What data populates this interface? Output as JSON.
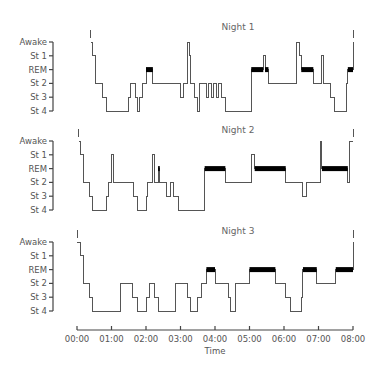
{
  "chart_data": {
    "type": "line",
    "subtype": "hypnogram (step plot)",
    "xlabel": "Time",
    "x_ticks": [
      "00:00",
      "01:00",
      "02:00",
      "03:00",
      "04:00",
      "05:00",
      "06:00",
      "07:00",
      "08:00"
    ],
    "xlim_hours": [
      0,
      8
    ],
    "y_levels": [
      "Awake",
      "St 1",
      "REM",
      "St 2",
      "St 3",
      "St 4"
    ],
    "legend": null,
    "grid": false,
    "annotations": "REM periods drawn as thick black bars",
    "panels": [
      {
        "title": "Night 1",
        "steps": [
          [
            0.4,
            "Awake"
          ],
          [
            0.45,
            "St 1"
          ],
          [
            0.55,
            "St 2"
          ],
          [
            0.75,
            "St 3"
          ],
          [
            0.85,
            "St 4"
          ],
          [
            1.5,
            "St 3"
          ],
          [
            1.55,
            "St 2"
          ],
          [
            1.7,
            "St 3"
          ],
          [
            1.75,
            "St 4"
          ],
          [
            1.8,
            "St 3"
          ],
          [
            1.9,
            "St 2"
          ],
          [
            2.0,
            "REM"
          ],
          [
            2.2,
            "St 2"
          ],
          [
            3.0,
            "St 3"
          ],
          [
            3.1,
            "St 2"
          ],
          [
            3.2,
            "Awake"
          ],
          [
            3.25,
            "St 1"
          ],
          [
            3.3,
            "St 2"
          ],
          [
            3.4,
            "St 3"
          ],
          [
            3.5,
            "St 4"
          ],
          [
            3.55,
            "St 2"
          ],
          [
            3.75,
            "St 3"
          ],
          [
            3.8,
            "St 2"
          ],
          [
            3.9,
            "St 3"
          ],
          [
            3.95,
            "St 2"
          ],
          [
            4.05,
            "St 3"
          ],
          [
            4.1,
            "St 2"
          ],
          [
            4.2,
            "St 3"
          ],
          [
            4.3,
            "St 4"
          ],
          [
            5.05,
            "REM"
          ],
          [
            5.4,
            "St 1"
          ],
          [
            5.45,
            "REM"
          ],
          [
            5.55,
            "St 2"
          ],
          [
            6.35,
            "Awake"
          ],
          [
            6.45,
            "St 1"
          ],
          [
            6.5,
            "REM"
          ],
          [
            6.85,
            "St 2"
          ],
          [
            7.1,
            "St 1"
          ],
          [
            7.15,
            "St 2"
          ],
          [
            7.35,
            "St 3"
          ],
          [
            7.45,
            "St 4"
          ],
          [
            7.8,
            "St 2"
          ],
          [
            7.85,
            "REM"
          ],
          [
            8.0,
            "Awake"
          ]
        ]
      },
      {
        "title": "Night 2",
        "steps": [
          [
            0.05,
            "Awake"
          ],
          [
            0.1,
            "St 1"
          ],
          [
            0.2,
            "St 2"
          ],
          [
            0.35,
            "St 3"
          ],
          [
            0.45,
            "St 4"
          ],
          [
            0.85,
            "St 3"
          ],
          [
            0.9,
            "St 2"
          ],
          [
            1.0,
            "St 1"
          ],
          [
            1.05,
            "St 2"
          ],
          [
            1.65,
            "St 3"
          ],
          [
            1.75,
            "St 4"
          ],
          [
            2.0,
            "St 3"
          ],
          [
            2.05,
            "St 2"
          ],
          [
            2.2,
            "St 1"
          ],
          [
            2.25,
            "St 2"
          ],
          [
            2.35,
            "REM"
          ],
          [
            2.4,
            "St 2"
          ],
          [
            2.6,
            "St 3"
          ],
          [
            2.7,
            "St 2"
          ],
          [
            2.8,
            "St 3"
          ],
          [
            2.95,
            "St 4"
          ],
          [
            3.7,
            "REM"
          ],
          [
            4.3,
            "St 2"
          ],
          [
            5.05,
            "St 1"
          ],
          [
            5.15,
            "REM"
          ],
          [
            6.05,
            "St 2"
          ],
          [
            6.55,
            "St 3"
          ],
          [
            6.65,
            "St 2"
          ],
          [
            7.05,
            "Awake"
          ],
          [
            7.1,
            "REM"
          ],
          [
            7.85,
            "St 2"
          ],
          [
            7.9,
            "Awake"
          ],
          [
            8.0,
            "Awake"
          ]
        ]
      },
      {
        "title": "Night 3",
        "steps": [
          [
            0.0,
            "Awake"
          ],
          [
            0.1,
            "St 1"
          ],
          [
            0.2,
            "St 2"
          ],
          [
            0.35,
            "St 3"
          ],
          [
            0.45,
            "St 4"
          ],
          [
            1.25,
            "St 2"
          ],
          [
            1.6,
            "St 3"
          ],
          [
            1.75,
            "St 4"
          ],
          [
            2.0,
            "St 3"
          ],
          [
            2.1,
            "St 2"
          ],
          [
            2.25,
            "St 3"
          ],
          [
            2.35,
            "St 4"
          ],
          [
            2.85,
            "St 2"
          ],
          [
            3.2,
            "St 3"
          ],
          [
            3.3,
            "St 4"
          ],
          [
            3.5,
            "St 3"
          ],
          [
            3.6,
            "St 2"
          ],
          [
            3.75,
            "REM"
          ],
          [
            4.0,
            "St 2"
          ],
          [
            4.4,
            "St 3"
          ],
          [
            4.45,
            "St 4"
          ],
          [
            4.6,
            "St 2"
          ],
          [
            5.0,
            "REM"
          ],
          [
            5.75,
            "St 2"
          ],
          [
            6.05,
            "St 3"
          ],
          [
            6.2,
            "St 4"
          ],
          [
            6.5,
            "St 3"
          ],
          [
            6.55,
            "REM"
          ],
          [
            6.95,
            "St 2"
          ],
          [
            7.5,
            "REM"
          ],
          [
            8.0,
            "Awake"
          ]
        ]
      }
    ]
  },
  "labels": {
    "y": [
      "Awake",
      "St 1",
      "REM",
      "St 2",
      "St 3",
      "St 4"
    ],
    "x": [
      "00:00",
      "01:00",
      "02:00",
      "03:00",
      "04:00",
      "05:00",
      "06:00",
      "07:00",
      "08:00"
    ],
    "xlabel": "Time",
    "panel_titles": [
      "Night 1",
      "Night 2",
      "Night 3"
    ]
  }
}
